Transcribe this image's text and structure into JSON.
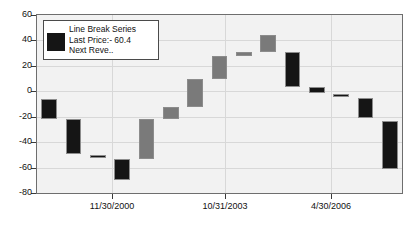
{
  "chart_data": {
    "type": "bar",
    "title": "",
    "xlabel": "",
    "ylabel": "",
    "ylim": [
      -80,
      60
    ],
    "yticks": [
      60,
      40,
      20,
      0,
      -20,
      -40,
      -60,
      -80
    ],
    "ytick_labels": [
      "60",
      "40",
      "20",
      "0",
      "-20",
      "-40",
      "-60",
      "-80"
    ],
    "xtick_labels": [
      "11/30/2000",
      "10/31/2003",
      "4/30/2006"
    ],
    "xtick_positions": [
      0.205,
      0.515,
      0.805
    ],
    "grid": true,
    "legend_position": "upper-left",
    "series_name": "Line Break Series",
    "colors": {
      "down": "#151515",
      "up": "#7a7a7a",
      "border": "#8c8c8c",
      "plot_bg": "#f2f2f2",
      "grid": "#d8d8d8",
      "axis": "#6e6e6e"
    },
    "bars": [
      {
        "index": 1,
        "open": -6.0,
        "close": -22.0,
        "direction": "down",
        "color": "#151515"
      },
      {
        "index": 2,
        "open": -22.0,
        "close": -49.0,
        "direction": "down",
        "color": "#151515"
      },
      {
        "index": 3,
        "open": -50.0,
        "close": -52.0,
        "direction": "down",
        "color": "#151515"
      },
      {
        "index": 4,
        "open": -53.0,
        "close": -70.0,
        "direction": "down",
        "color": "#151515"
      },
      {
        "index": 5,
        "open": -53.0,
        "close": -22.0,
        "direction": "up",
        "color": "#7a7a7a"
      },
      {
        "index": 6,
        "open": -22.0,
        "close": -12.0,
        "direction": "up",
        "color": "#7a7a7a"
      },
      {
        "index": 7,
        "open": -12.0,
        "close": 10.0,
        "direction": "up",
        "color": "#7a7a7a"
      },
      {
        "index": 8,
        "open": 10.0,
        "close": 28.0,
        "direction": "up",
        "color": "#7a7a7a"
      },
      {
        "index": 9,
        "open": 28.0,
        "close": 31.0,
        "direction": "up",
        "color": "#7a7a7a"
      },
      {
        "index": 10,
        "open": 31.0,
        "close": 44.0,
        "direction": "up",
        "color": "#7a7a7a"
      },
      {
        "index": 11,
        "open": 31.0,
        "close": 3.0,
        "direction": "down",
        "color": "#151515"
      },
      {
        "index": 12,
        "open": 3.0,
        "close": -1.5,
        "direction": "down",
        "color": "#151515"
      },
      {
        "index": 13,
        "open": -2.0,
        "close": -4.0,
        "direction": "down",
        "color": "#151515"
      },
      {
        "index": 14,
        "open": -5.0,
        "close": -21.0,
        "direction": "down",
        "color": "#151515"
      },
      {
        "index": 15,
        "open": -23.0,
        "close": -61.0,
        "direction": "down",
        "color": "#151515"
      }
    ]
  },
  "legend": {
    "line1": "Line Break Series",
    "line2": "Last Price:- 60.4",
    "line3": "Next Reve.."
  }
}
